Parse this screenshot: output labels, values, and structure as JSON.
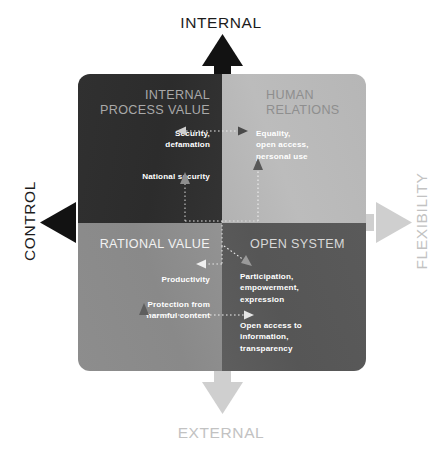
{
  "figure": {
    "type": "quadrant-framework-diagram",
    "axes": {
      "top": {
        "label": "INTERNAL",
        "color": "#1c1c1c",
        "direction": "up"
      },
      "bottom": {
        "label": "EXTERNAL",
        "color": "#c2c2c2",
        "direction": "down"
      },
      "left": {
        "label": "CONTROL",
        "color": "#1c1c1c",
        "direction": "left"
      },
      "right": {
        "label": "FLEXIBILITY",
        "color": "#c2c2c2",
        "direction": "right"
      }
    },
    "quadrants": {
      "top_left": {
        "title": "INTERNAL\nPROCESS VALUE",
        "background": "#2e2e2e",
        "title_color": "#a9a9a9",
        "items": [
          "Security,\ndefamation",
          "National security"
        ]
      },
      "top_right": {
        "title": "HUMAN\nRELATIONS",
        "background": "#b8b8b8",
        "title_color": "#8e8e8e",
        "items": [
          "Equality,\nopen access,\npersonal use"
        ]
      },
      "bottom_left": {
        "title": "RATIONAL VALUE",
        "background": "#8d8d8d",
        "title_color": "#f2f2f2",
        "items": [
          "Productivity",
          "Protection from\nharmful content"
        ]
      },
      "bottom_right": {
        "title": "OPEN SYSTEM",
        "background": "#5a5a5a",
        "title_color": "#d8d8d8",
        "items": [
          "Participation,\nempowerment,\nexpression",
          "Open access to\ninformation,\ntransparency"
        ]
      }
    },
    "connectors": [
      {
        "name": "equality-to-security",
        "from": "top_right.items.0",
        "to": "top_left.items.0",
        "style": "dotted",
        "arrows": "both"
      },
      {
        "name": "national-security-up",
        "from": "center",
        "to": "top_left.items.1",
        "style": "dotted",
        "arrows": "end"
      },
      {
        "name": "equality-up",
        "from": "center",
        "to": "top_right.items.0",
        "style": "dotted",
        "arrows": "end"
      },
      {
        "name": "center-to-productivity",
        "from": "center",
        "to": "bottom_left.items.0",
        "style": "dotted",
        "arrows": "end"
      },
      {
        "name": "center-to-participation",
        "from": "center",
        "to": "bottom_right.items.0",
        "style": "dotted",
        "arrows": "end"
      },
      {
        "name": "protection-to-open-access",
        "from": "bottom_left.items.1",
        "to": "bottom_right.items.1",
        "style": "dotted",
        "arrows": "both"
      }
    ],
    "caption": ""
  }
}
